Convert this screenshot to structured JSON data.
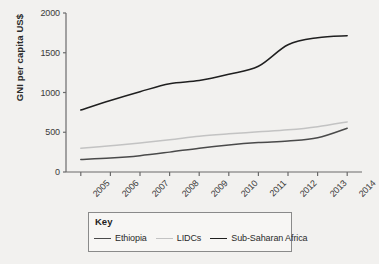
{
  "chart_data": {
    "type": "line",
    "title": "",
    "xlabel": "",
    "ylabel": "GNI per capita US$",
    "categories": [
      "2005",
      "2006",
      "2007",
      "2008",
      "2009",
      "2010",
      "2011",
      "2012",
      "2013",
      "2014"
    ],
    "x": [
      2005,
      2006,
      2007,
      2008,
      2009,
      2010,
      2011,
      2012,
      2013,
      2014
    ],
    "ylim": [
      0,
      2000
    ],
    "yticks": [
      0,
      500,
      1000,
      1500,
      2000
    ],
    "ytick_labels": [
      "0",
      "500",
      "1000",
      "1500",
      "2000"
    ],
    "grid": false,
    "legend_position": "below-plot",
    "legend_title": "Key",
    "series": [
      {
        "name": "Ethiopia",
        "color": "#4a4a4a",
        "values": [
          157,
          175,
          205,
          250,
          300,
          340,
          370,
          390,
          430,
          550
        ]
      },
      {
        "name": "LIDCs",
        "color": "#c3c3c3",
        "values": [
          300,
          330,
          365,
          405,
          450,
          480,
          505,
          530,
          570,
          630
        ]
      },
      {
        "name": "Sub-Saharan Africa",
        "color": "#1f1f1f",
        "values": [
          780,
          900,
          1010,
          1110,
          1150,
          1230,
          1330,
          1600,
          1690,
          1715
        ]
      }
    ]
  },
  "axes": {
    "plot_left": 66,
    "plot_right": 362,
    "plot_top": 13,
    "plot_bottom": 172
  }
}
